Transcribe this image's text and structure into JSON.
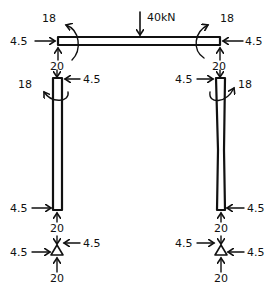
{
  "diagram": {
    "type": "free-body diagram of portal frame",
    "colors": {
      "ink": "#111111",
      "background": "#ffffff"
    },
    "beam": {
      "load_label": "40kN",
      "left_end": {
        "horizontal_force": "4.5",
        "vertical_force": "20",
        "moment": "18"
      },
      "right_end": {
        "horizontal_force": "4.5",
        "vertical_force": "20",
        "moment": "18"
      }
    },
    "left_column": {
      "top": {
        "horizontal_force": "4.5",
        "vertical_force": "20",
        "moment": "18"
      },
      "bottom": {
        "horizontal_force": "4.5",
        "vertical_force": "20"
      }
    },
    "right_column": {
      "top": {
        "horizontal_force": "4.5",
        "vertical_force": "20",
        "moment": "18"
      },
      "bottom": {
        "horizontal_force": "4.5",
        "vertical_force": "20"
      }
    },
    "left_support": {
      "horizontal_force_top": "4.5",
      "horizontal_force_left": "4.5",
      "vertical_force": "20"
    },
    "right_support": {
      "horizontal_force_left": "4.5",
      "horizontal_force_right": "4.5",
      "vertical_force": "20"
    }
  }
}
